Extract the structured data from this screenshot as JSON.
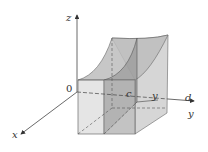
{
  "diagram": {
    "type": "3d-solid-under-surface",
    "axes": {
      "x_label": "x",
      "y_label": "y",
      "z_label": "z",
      "origin_label": "0"
    },
    "y_axis_marks": {
      "c": "c",
      "y": "y",
      "d": "d"
    },
    "colors": {
      "solid_fill": "#b8b8b8",
      "slice_fill": "#8c8c8c",
      "top_surface": "#c4c4c4",
      "edge": "#555555",
      "axis": "#444444"
    }
  }
}
